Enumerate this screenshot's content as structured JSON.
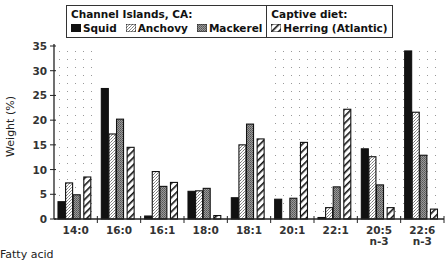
{
  "chart_data": {
    "type": "bar",
    "title": "",
    "xlabel": "Fatty acid",
    "ylabel": "Weight (%)",
    "ylim": [
      0,
      35
    ],
    "yticks": [
      0,
      5,
      10,
      15,
      20,
      25,
      30,
      35
    ],
    "grid": false,
    "legend_position": "top",
    "legend_groups": [
      {
        "title": "Channel Islands, CA:",
        "entries": [
          "Squid",
          "Anchovy",
          "Mackerel"
        ]
      },
      {
        "title": "Captive diet:",
        "entries": [
          "Herring (Atlantic)"
        ]
      }
    ],
    "categories": [
      "14:0",
      "16:0",
      "16:1",
      "18:0",
      "18:1",
      "20:1",
      "22:1",
      "20:5 n-3",
      "22:6 n-3"
    ],
    "category_lines": [
      [
        "14:0"
      ],
      [
        "16:0"
      ],
      [
        "16:1"
      ],
      [
        "18:0"
      ],
      [
        "18:1"
      ],
      [
        "20:1"
      ],
      [
        "22:1"
      ],
      [
        "20:5",
        "n-3"
      ],
      [
        "22:6",
        "n-3"
      ]
    ],
    "series": [
      {
        "name": "Squid",
        "pattern": "solid-black",
        "values": [
          3.5,
          26.4,
          0.6,
          5.6,
          4.3,
          4.0,
          0.3,
          14.2,
          34.0
        ]
      },
      {
        "name": "Anchovy",
        "pattern": "light-stipple",
        "values": [
          7.3,
          17.2,
          9.6,
          5.7,
          15.0,
          0.0,
          2.3,
          12.6,
          21.6
        ]
      },
      {
        "name": "Mackerel",
        "pattern": "dark-stipple",
        "values": [
          4.9,
          20.2,
          6.6,
          6.2,
          19.2,
          4.2,
          6.5,
          6.9,
          12.9
        ]
      },
      {
        "name": "Herring (Atlantic)",
        "pattern": "diagonal-hatch",
        "values": [
          8.5,
          14.5,
          7.4,
          0.7,
          16.2,
          15.5,
          22.2,
          2.3,
          2.0
        ]
      }
    ],
    "shaded_regions": [
      {
        "from_category": "14:0",
        "to_category": "14:0"
      },
      {
        "from_category": "20:1",
        "to_category": "22:6 n-3"
      }
    ]
  },
  "legend": {
    "group1_title": "Channel Islands, CA:",
    "group2_title": "Captive diet:",
    "squid": "Squid",
    "anchovy": "Anchovy",
    "mackerel": "Mackerel",
    "herring": "Herring (Atlantic)"
  },
  "axes": {
    "xlabel": "Fatty acid",
    "ylabel": "Weight (%)"
  }
}
